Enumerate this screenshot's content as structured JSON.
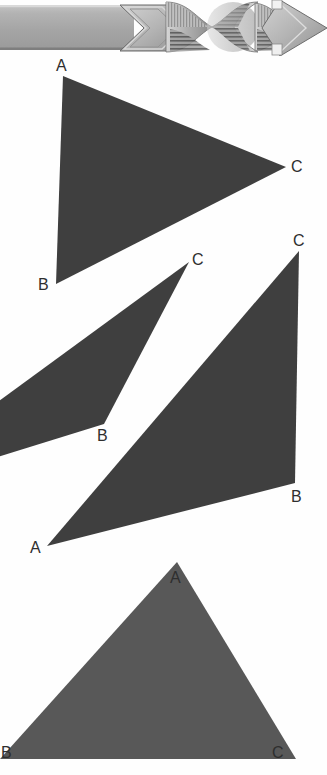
{
  "page": {
    "width": 327,
    "height": 775,
    "background_color": "#fefefe",
    "kind": "scanned-geometry-figure-page"
  },
  "banner": {
    "name": "twisted-ribbon-banner",
    "description": "Decorative grayscale twisted-ribbon arrow banner spanning the top of the page",
    "bar_color": "#a8a8a8",
    "bar_light": "#c9c9c9",
    "bar_dark": "#7e7e7e",
    "outline_color": "#5c5c5c",
    "twist_count": 3,
    "arrowhead_shape": "diamond",
    "bar_start_x": 0,
    "bar_end_x": 132,
    "bar_top_y": 5,
    "bar_bottom_y": 50
  },
  "figure": {
    "title": "",
    "triangle_fill_dark": "#3f3f3f",
    "triangle_fill_light": "#585858",
    "label_color": "#2e2e2e",
    "triangles": [
      {
        "id": "triangle-1",
        "name": "triangle-top",
        "fill": "#3f3f3f",
        "clipped": false,
        "vertices": [
          {
            "label": "A",
            "x": 63,
            "y": 76,
            "label_x": 56,
            "label_y": 58
          },
          {
            "label": "B",
            "x": 56,
            "y": 284,
            "label_x": 38,
            "label_y": 277
          },
          {
            "label": "C",
            "x": 286,
            "y": 167,
            "label_x": 291,
            "label_y": 159
          }
        ]
      },
      {
        "id": "triangle-2",
        "name": "triangle-middle-left-clipped",
        "fill": "#3f3f3f",
        "clipped": true,
        "clip_note": "third vertex A lies off the left edge of the page",
        "vertices": [
          {
            "label": "C",
            "x": 189,
            "y": 262,
            "label_x": 192,
            "label_y": 252
          },
          {
            "label": "B",
            "x": 104,
            "y": 424,
            "label_x": 97,
            "label_y": 428
          },
          {
            "label": "A",
            "x": -132,
            "y": 497,
            "label_x": null,
            "label_y": null
          }
        ]
      },
      {
        "id": "triangle-3",
        "name": "triangle-middle-right",
        "fill": "#3f3f3f",
        "clipped": false,
        "vertices": [
          {
            "label": "C",
            "x": 299,
            "y": 251,
            "label_x": 293,
            "label_y": 233
          },
          {
            "label": "B",
            "x": 295,
            "y": 483,
            "label_x": 291,
            "label_y": 489
          },
          {
            "label": "A",
            "x": 47,
            "y": 546,
            "label_x": 30,
            "label_y": 540
          }
        ]
      },
      {
        "id": "triangle-4",
        "name": "triangle-bottom",
        "fill": "#585858",
        "clipped": true,
        "clip_note": "bottom edge runs to the bottom border of the page; B is at the left page edge",
        "vertices": [
          {
            "label": "A",
            "x": 177,
            "y": 562,
            "label_x": 170,
            "label_y": 570
          },
          {
            "label": "B",
            "x": 0,
            "y": 759,
            "label_x": 1,
            "label_y": 745
          },
          {
            "label": "C",
            "x": 296,
            "y": 759,
            "label_x": 272,
            "label_y": 745
          }
        ]
      }
    ]
  }
}
